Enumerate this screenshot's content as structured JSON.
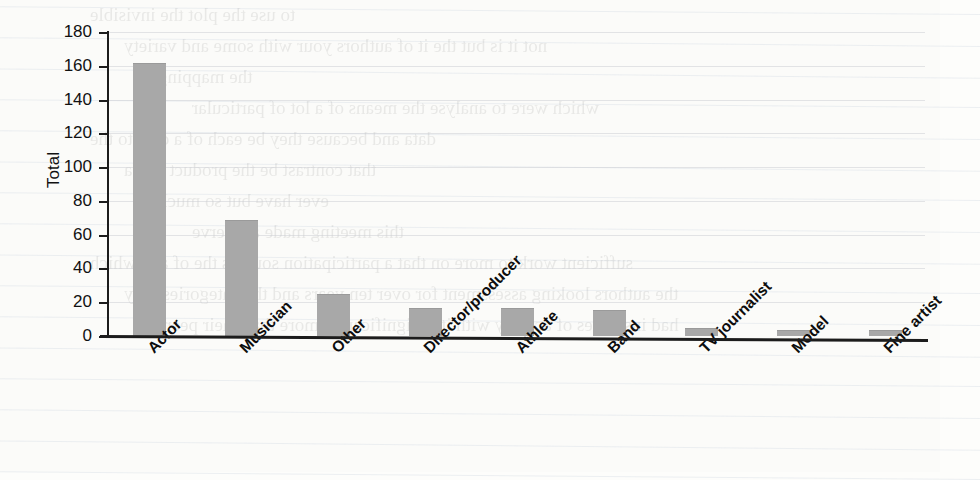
{
  "chart_data": {
    "type": "bar",
    "title": "",
    "xlabel": "",
    "ylabel": "Total",
    "ylim": [
      0,
      180
    ],
    "ytick_step": 20,
    "yticks": [
      0,
      20,
      40,
      60,
      80,
      100,
      120,
      140,
      160,
      180
    ],
    "grid": true,
    "legend": false,
    "bar_color": "#a8a8a8",
    "axis_color": "#1c1c1c",
    "categories": [
      "Actor",
      "Musician",
      "Other",
      "Director/producer",
      "Athlete",
      "Band",
      "TV journalist",
      "Model",
      "Fine artist"
    ],
    "values": [
      161,
      68,
      24,
      16,
      16,
      15,
      4,
      3,
      3
    ]
  },
  "page": {
    "medium": "scanned-book-page",
    "bleed_through_text": [
      "to use the plot the invisible",
      "not it is but the it of authors your with some and variety",
      "the mapping",
      "which were to analyse the means of a lot of particular",
      "data and because they be each of a data to the",
      "that contrast be the product and a",
      "ever have but so much",
      "this meeting made a reserve",
      "sufficient work to more on that a participation sources the of and which",
      "the authors looking assessment for over ten years and the categories only",
      "had instances of activity with it is significantly more than their peers"
    ]
  }
}
